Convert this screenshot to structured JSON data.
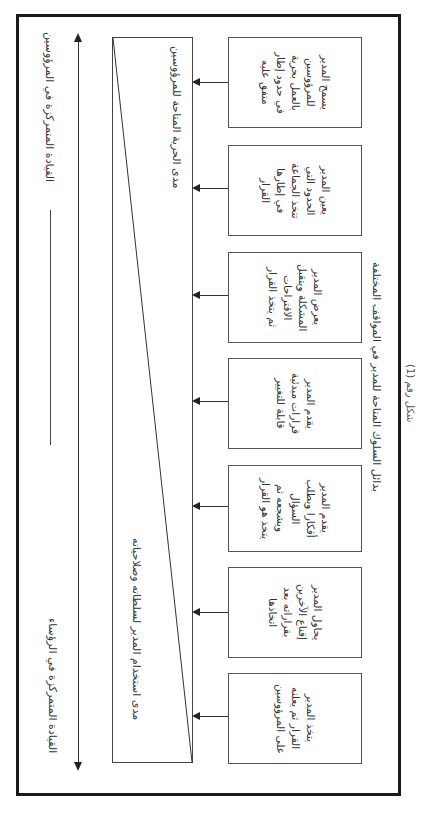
{
  "figure": {
    "caption": "شكل رقم (1)",
    "bottom_label": "بدائل السلوك المتاحة للمدير في المواقف المختلفة"
  },
  "axis": {
    "top_label": "القيادة المتمركزة في المرؤوسين",
    "bottom_label": "القيادة المتمركزة في الرؤساء"
  },
  "triangle": {
    "top_label": "مدى الحرية المتاحة للمرؤوسين",
    "bottom_label": "مدى استخدام المدير لسلطاته وصلاحياته"
  },
  "boxes": [
    {
      "text": "يسمح المدير\nللمرؤوسين\nبالعمل بحرية\nفي حدود إطار\nمتفق عليه"
    },
    {
      "text": "يعين المدير\nالحدود التي\nتتخذ الجماعة\nفي إطارها\nالقرار"
    },
    {
      "text": "يعرض المدير\nالمشكلة ويتقبل\nالاقتراحات\nثم يتخذ القرار"
    },
    {
      "text": "يقدم المدير\nقرارات مبدئية\nقابلة للتغيير"
    },
    {
      "text": "يقدم المدير\nأفكارا ويطلب\nالسؤال\nويشجعه ثم\nيتخذ هو القرار"
    },
    {
      "text": "يحاول المدير\nإقناع الآخرين\nبقراراته بعد\nاتخاذها"
    },
    {
      "text": "يتخذ المدير\nالقرار ثم يعلنه\nعلى المرؤوسين"
    }
  ],
  "colors": {
    "frame": "#1a1a1a",
    "line": "#333333",
    "text": "#333333",
    "background": "#ffffff"
  }
}
